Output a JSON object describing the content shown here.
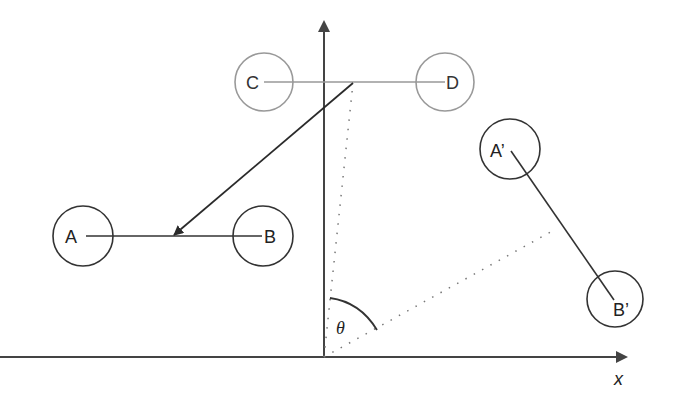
{
  "diagram": {
    "labels": {
      "A": "A",
      "B": "B",
      "C": "C",
      "D": "D",
      "A_prime": "A’",
      "B_prime": "B’",
      "theta": "θ",
      "x_axis": "x"
    },
    "colors": {
      "primary": "#2a2a2a",
      "faded": "#999999",
      "dotted": "#777777"
    },
    "nodes": [
      {
        "id": "A",
        "cx": 83,
        "cy": 236,
        "r": 30
      },
      {
        "id": "B",
        "cx": 263,
        "cy": 236,
        "r": 30
      },
      {
        "id": "C",
        "cx": 264,
        "cy": 82,
        "r": 29
      },
      {
        "id": "D",
        "cx": 445,
        "cy": 82,
        "r": 29
      },
      {
        "id": "A_prime",
        "cx": 510,
        "cy": 149,
        "r": 30
      },
      {
        "id": "B_prime",
        "cx": 615,
        "cy": 299,
        "r": 28
      }
    ],
    "edges": [
      {
        "from": "A",
        "to": "B"
      },
      {
        "from": "C",
        "to": "D",
        "style": "faded"
      },
      {
        "from": "A_prime",
        "to": "B_prime"
      }
    ],
    "axes": {
      "origin": [
        324,
        357
      ],
      "x_end": [
        626,
        357
      ],
      "y_end": [
        324,
        22
      ]
    },
    "arrow": {
      "from": [
        353,
        83
      ],
      "to": [
        173,
        236
      ]
    },
    "angle": {
      "symbol": "θ",
      "between": [
        "y-axis",
        "rotated dotted line"
      ]
    }
  }
}
